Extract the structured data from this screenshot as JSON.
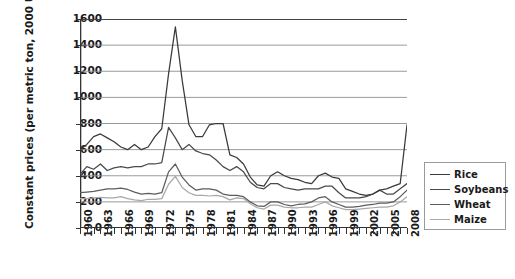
{
  "chart_data": {
    "type": "line",
    "title": "",
    "xlabel": "",
    "ylabel": "Constant prices (per metric ton, 2000 USD)",
    "ylim": [
      0,
      1600
    ],
    "ytick_step": 200,
    "yticks": [
      1600,
      1400,
      1200,
      1000,
      800,
      600,
      400,
      200,
      0
    ],
    "grid": true,
    "grid_axis": "y",
    "legend_position": "right",
    "xlim": [
      1960,
      2008
    ],
    "x": [
      1960,
      1961,
      1962,
      1963,
      1964,
      1965,
      1966,
      1967,
      1968,
      1969,
      1970,
      1971,
      1972,
      1973,
      1974,
      1975,
      1976,
      1977,
      1978,
      1979,
      1980,
      1981,
      1982,
      1983,
      1984,
      1985,
      1986,
      1987,
      1988,
      1989,
      1990,
      1991,
      1992,
      1993,
      1994,
      1995,
      1996,
      1997,
      1998,
      1999,
      2000,
      2001,
      2002,
      2003,
      2004,
      2005,
      2006,
      2007,
      2008
    ],
    "xtick_labels": [
      "1960",
      "1963",
      "1966",
      "1969",
      "1972",
      "1975",
      "1978",
      "1981",
      "1984",
      "1987",
      "1990",
      "1993",
      "1996",
      "1999",
      "2002",
      "2005",
      "2008"
    ],
    "xtick_step": 3,
    "series": [
      {
        "name": "Rice",
        "color": "#3a3a3a",
        "values": [
          600,
          640,
          700,
          720,
          690,
          660,
          620,
          600,
          640,
          600,
          620,
          700,
          760,
          1180,
          1540,
          1130,
          790,
          700,
          700,
          790,
          800,
          800,
          560,
          540,
          490,
          390,
          330,
          320,
          400,
          430,
          400,
          380,
          370,
          350,
          340,
          400,
          420,
          390,
          380,
          300,
          280,
          260,
          250,
          260,
          290,
          300,
          320,
          340,
          790
        ]
      },
      {
        "name": "Soybeans",
        "color": "#4a4a4a",
        "values": [
          410,
          470,
          450,
          490,
          440,
          460,
          470,
          460,
          470,
          470,
          490,
          490,
          500,
          770,
          690,
          600,
          640,
          590,
          570,
          560,
          520,
          470,
          440,
          470,
          430,
          350,
          310,
          300,
          340,
          340,
          310,
          300,
          290,
          300,
          300,
          300,
          320,
          320,
          270,
          230,
          230,
          230,
          240,
          260,
          290,
          260,
          260,
          300,
          340
        ]
      },
      {
        "name": "Wheat",
        "color": "#5c5c5c",
        "values": [
          270,
          275,
          280,
          290,
          300,
          300,
          305,
          295,
          275,
          260,
          265,
          260,
          270,
          430,
          490,
          390,
          330,
          290,
          300,
          300,
          290,
          260,
          250,
          250,
          240,
          200,
          170,
          165,
          200,
          200,
          180,
          170,
          180,
          185,
          200,
          230,
          240,
          200,
          180,
          160,
          160,
          165,
          175,
          180,
          190,
          190,
          200,
          240,
          290
        ]
      },
      {
        "name": "Maize",
        "color": "#a8a8a8",
        "values": [
          225,
          225,
          230,
          235,
          230,
          230,
          240,
          225,
          215,
          210,
          220,
          220,
          225,
          335,
          395,
          310,
          270,
          250,
          250,
          245,
          250,
          240,
          215,
          230,
          225,
          185,
          155,
          145,
          175,
          175,
          160,
          155,
          155,
          160,
          160,
          180,
          200,
          170,
          155,
          140,
          140,
          145,
          150,
          155,
          160,
          160,
          170,
          200,
          240
        ]
      }
    ]
  },
  "legend": {
    "items": [
      {
        "label": "Rice"
      },
      {
        "label": "Soybeans"
      },
      {
        "label": "Wheat"
      },
      {
        "label": "Maize"
      }
    ]
  }
}
